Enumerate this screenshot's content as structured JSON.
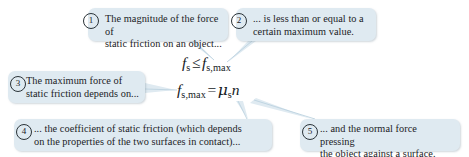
{
  "diagram": {
    "colors": {
      "callout_fill": "#dfeaf1",
      "text": "#1b2226",
      "connector": "#c3d6e2",
      "background": "#ffffff"
    },
    "callouts": [
      {
        "number": "1",
        "text": "The magnitude of the force of\nstatic friction on an object...",
        "name": "callout-1"
      },
      {
        "number": "2",
        "text": "... is less than or equal to a\ncertain maximum value.",
        "name": "callout-2"
      },
      {
        "number": "3",
        "text": "The maximum force of\nstatic friction depends on...",
        "name": "callout-3"
      },
      {
        "number": "4",
        "text": "... the coefficient of static friction (which depends\non the properties of the two surfaces in contact)...",
        "name": "callout-4"
      },
      {
        "number": "5",
        "text": "... and the normal force pressing\nthe object against a surface.",
        "name": "callout-5"
      }
    ],
    "equations": [
      {
        "name": "inequality",
        "plain": "f_s <= f_s,max",
        "lhs_symbol": "f",
        "lhs_sub": "s",
        "operator": "≤",
        "rhs_symbol": "f",
        "rhs_sub": "s,max"
      },
      {
        "name": "max-static-friction",
        "plain": "f_s,max = μ_s n",
        "lhs_symbol": "f",
        "lhs_sub": "s,max",
        "operator": "=",
        "rhs_coefficient": "μ",
        "rhs_coefficient_sub": "s",
        "rhs_variable": "n"
      }
    ]
  }
}
